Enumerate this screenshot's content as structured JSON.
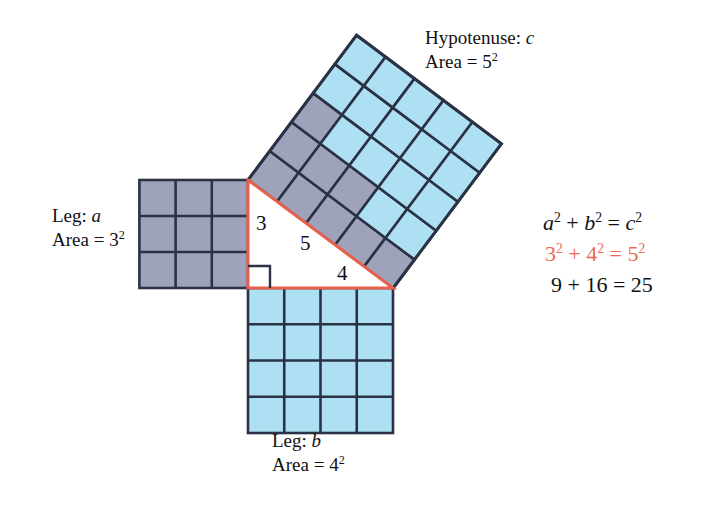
{
  "figure": {
    "colors": {
      "square_a_fill": "#9ea3bb",
      "square_b_fill": "#ade0f2",
      "square_c_gray_fill": "#9ea3bb",
      "square_c_blue_fill": "#ade0f2",
      "grid_stroke": "#2b3245",
      "triangle_stroke": "#e8604c",
      "triangle_fill": "#ffffff",
      "right_angle_stroke": "#2b3245",
      "text": "#111111",
      "accent_red": "#ea6a56",
      "background": "#ffffff"
    },
    "labels": {
      "hypotenuse_line1_prefix": "Hypotenuse: ",
      "hypotenuse_line1_symbol": "c",
      "hypotenuse_line2_prefix": "Area = 5",
      "hypotenuse_line2_exponent": "2",
      "leg_a_line1_prefix": "Leg: ",
      "leg_a_line1_symbol": "a",
      "leg_a_line2_prefix": "Area = 3",
      "leg_a_line2_exponent": "2",
      "leg_b_line1_prefix": "Leg: ",
      "leg_b_line1_symbol": "b",
      "leg_b_line2_prefix": "Area = 4",
      "leg_b_line2_exponent": "2"
    },
    "side_lengths": {
      "a": "3",
      "b": "4",
      "c": "5"
    },
    "equation": {
      "row1": {
        "a_sym": "a",
        "a_exp": "2",
        "plus": " + ",
        "b_sym": "b",
        "b_exp": "2",
        "equals": " = ",
        "c_sym": "c",
        "c_exp": "2"
      },
      "row2": {
        "a_val": "3",
        "a_exp": "2",
        "plus": " + ",
        "b_val": "4",
        "b_exp": "2",
        "equals": " = ",
        "c_val": "5",
        "c_exp": "2"
      },
      "row3": {
        "a_sq": "9",
        "plus": " + ",
        "b_sq": "16",
        "equals": " = ",
        "c_sq": "25"
      }
    },
    "geometry": {
      "unit_px": 36.2,
      "triangle_vertices": {
        "right_angle": [
          248,
          288
        ],
        "top": [
          248,
          180
        ],
        "bottom_right": [
          393,
          288
        ]
      },
      "square_a_grid": "3x3",
      "square_b_grid": "4x4",
      "square_c_grid": "5x5",
      "square_c_rotation_deg": -36.87,
      "square_c_gray_cells": 9,
      "square_c_blue_cells": 16,
      "square_c_gray_staircase_rows": [
        5,
        3,
        1
      ]
    }
  }
}
